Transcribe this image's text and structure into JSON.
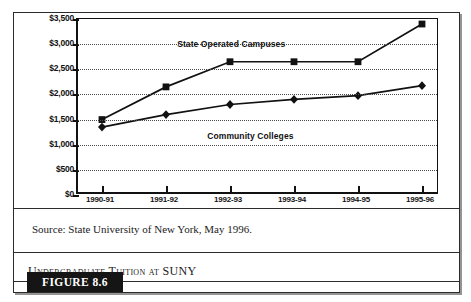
{
  "figure": {
    "tag_label": "FIGURE 8.6",
    "caption": "Undergraduate Tuition at SUNY",
    "source": "Source: State University of New York, May 1996."
  },
  "annotations": {
    "upper_series_label": "State Operated Campuses",
    "lower_series_label": "Community Colleges"
  },
  "axis": {
    "y_ticks": [
      "$3,500",
      "$3,000",
      "$2,500",
      "$2,000",
      "$1,500",
      "$1,000",
      "$500",
      "$0"
    ],
    "x_ticks": [
      "1990-91",
      "1991-92",
      "1992-93",
      "1993-94",
      "1994-95",
      "1995-96"
    ]
  },
  "colors": {
    "ink": "#111111",
    "frame": "#2b2b2b",
    "grid": "#4a4a4a",
    "tag_background": "#151515",
    "tag_text": "#ffffff"
  },
  "chart_data": {
    "type": "line",
    "title": "Undergraduate Tuition at SUNY",
    "xlabel": "",
    "ylabel": "",
    "ylim": [
      0,
      3500
    ],
    "ytick_values": [
      3500,
      3000,
      2500,
      2000,
      1500,
      1000,
      500,
      0
    ],
    "grid": true,
    "legend": "inline-annotations",
    "categories": [
      "1990-91",
      "1991-92",
      "1992-93",
      "1993-94",
      "1994-95",
      "1995-96"
    ],
    "series": [
      {
        "name": "State Operated Campuses",
        "marker": "square",
        "values": [
          1500,
          2150,
          2650,
          2650,
          2650,
          3400
        ]
      },
      {
        "name": "Community Colleges",
        "marker": "diamond",
        "values": [
          1350,
          1600,
          1800,
          1900,
          1975,
          2175
        ]
      }
    ]
  }
}
